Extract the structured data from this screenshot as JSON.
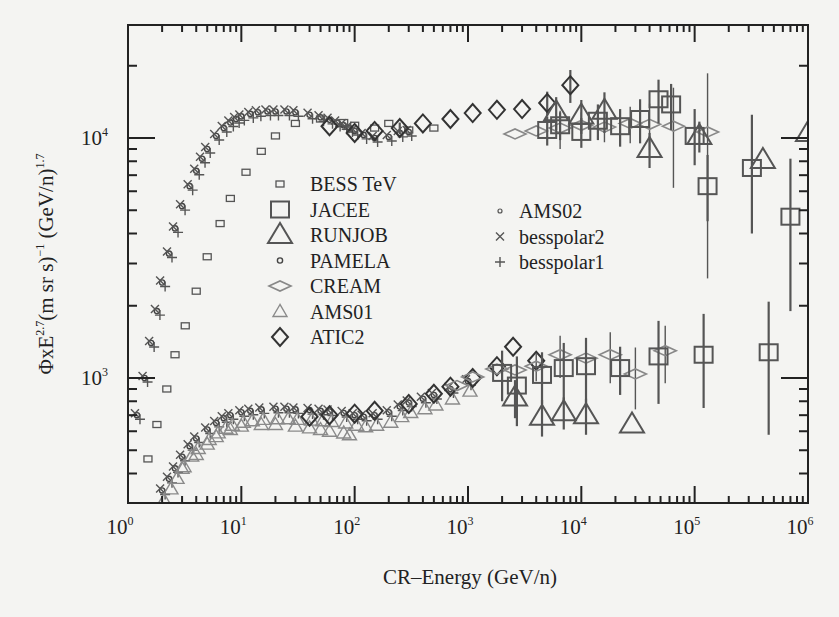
{
  "chart_data": {
    "type": "scatter",
    "title": "",
    "xlabel": "CR–Energy (GeV/n)",
    "ylabel": "ΦxE^2.7 (m sr s)^-1 (GeV/n)^1.7",
    "xscale": "log",
    "yscale": "log",
    "xlim": [
      1,
      1000000
    ],
    "ylim": [
      340,
      21000
    ],
    "x_ticks": [
      {
        "base": "10",
        "exp": "0",
        "value": 1
      },
      {
        "base": "10",
        "exp": "1",
        "value": 10
      },
      {
        "base": "10",
        "exp": "2",
        "value": 100
      },
      {
        "base": "10",
        "exp": "3",
        "value": 1000
      },
      {
        "base": "10",
        "exp": "4",
        "value": 10000
      },
      {
        "base": "10",
        "exp": "5",
        "value": 100000
      },
      {
        "base": "10",
        "exp": "6",
        "value": 1000000
      }
    ],
    "y_ticks": [
      {
        "base": "10",
        "exp": "3",
        "value": 1000
      },
      {
        "base": "10",
        "exp": "4",
        "value": 10000
      }
    ],
    "grid": false,
    "legend_position": "center-left (two columns)",
    "legend": [
      {
        "label": "BESS TeV",
        "marker": "small-square"
      },
      {
        "label": "JACEE",
        "marker": "large-square"
      },
      {
        "label": "RUNJOB",
        "marker": "large-triangle"
      },
      {
        "label": "PAMELA",
        "marker": "small-circle"
      },
      {
        "label": "CREAM",
        "marker": "flat-diamond"
      },
      {
        "label": "AMS01",
        "marker": "triangle-light"
      },
      {
        "label": "ATIC2",
        "marker": "diamond"
      },
      {
        "label": "AMS02",
        "marker": "tiny-circle"
      },
      {
        "label": "besspolar2",
        "marker": "x"
      },
      {
        "label": "besspolar1",
        "marker": "plus"
      }
    ],
    "series": [
      {
        "name": "Proton band (PAMELA/AMS/BESS combined)",
        "marker": "small-circle",
        "x": [
          1.2,
          1.4,
          1.6,
          1.8,
          2,
          2.3,
          2.6,
          3,
          3.5,
          4,
          4.5,
          5,
          6,
          7,
          8,
          9,
          10,
          12,
          14,
          17,
          20,
          25,
          30,
          40,
          50,
          60,
          70,
          80,
          90,
          100,
          120,
          150,
          200,
          250,
          300
        ],
        "y": [
          700,
          1000,
          1400,
          1900,
          2500,
          3300,
          4200,
          5200,
          6300,
          7300,
          8200,
          9000,
          10200,
          11000,
          11600,
          12000,
          12300,
          12600,
          12800,
          12900,
          12900,
          12900,
          12800,
          12500,
          12200,
          11900,
          11600,
          11300,
          11000,
          10700,
          10300,
          10000,
          10100,
          10500,
          10600
        ]
      },
      {
        "name": "BESS TeV (proton)",
        "marker": "small-square",
        "x": [
          1.5,
          1.8,
          2.2,
          2.6,
          3.2,
          4,
          5,
          6.5,
          8,
          11,
          15,
          20,
          30,
          50,
          80,
          100,
          150,
          200,
          300,
          500
        ],
        "y": [
          460,
          640,
          900,
          1250,
          1650,
          2300,
          3200,
          4400,
          5600,
          7200,
          8800,
          10200,
          11500,
          12000,
          11600,
          11300,
          11000,
          11500,
          10800,
          11000
        ]
      },
      {
        "name": "ATIC2 (proton)",
        "marker": "diamond",
        "x": [
          60,
          100,
          150,
          250,
          400,
          700,
          1100,
          1800,
          3000,
          5000,
          8000
        ],
        "y": [
          11200,
          10500,
          10700,
          11000,
          11500,
          12000,
          12700,
          13100,
          13200,
          14000,
          16600
        ],
        "err_lo": [
          0,
          0,
          0,
          600,
          0,
          0,
          0,
          0,
          0,
          1600,
          2600
        ],
        "err_hi": [
          0,
          0,
          0,
          600,
          0,
          0,
          0,
          0,
          0,
          1600,
          2600
        ]
      },
      {
        "name": "CREAM (proton)",
        "marker": "flat-diamond",
        "x": [
          2600,
          4000,
          6500,
          10000,
          16000,
          27000,
          40000,
          65000,
          130000
        ],
        "y": [
          10400,
          10700,
          11000,
          11300,
          11100,
          11500,
          11400,
          11200,
          10600
        ],
        "err_lo": [
          0,
          0,
          2000,
          1500,
          1500,
          2000,
          2500,
          5000,
          8000
        ],
        "err_hi": [
          0,
          0,
          2000,
          1500,
          1500,
          2000,
          2500,
          5000,
          8000
        ]
      },
      {
        "name": "JACEE (proton)",
        "marker": "large-square",
        "x": [
          5000,
          6500,
          10000,
          14000,
          22000,
          33000,
          48000,
          62000,
          100000,
          130000,
          320000,
          700000
        ],
        "y": [
          10800,
          11300,
          10600,
          11800,
          11200,
          12000,
          14500,
          13800,
          10200,
          6300,
          7500,
          4700
        ],
        "err_lo": [
          1500,
          1500,
          1500,
          2000,
          2000,
          2500,
          3000,
          3000,
          2500,
          1800,
          3500,
          2800
        ],
        "err_hi": [
          1500,
          1500,
          1500,
          2000,
          2000,
          2500,
          3000,
          3000,
          3000,
          2200,
          5000,
          3500
        ]
      },
      {
        "name": "RUNJOB (proton)",
        "marker": "large-triangle",
        "x": [
          6000,
          10000,
          16000,
          40000,
          110000,
          400000,
          1000000
        ],
        "y": [
          12800,
          12400,
          13000,
          9000,
          10200,
          8100,
          10500
        ],
        "err_lo": [
          2000,
          2000,
          2500,
          1500,
          1500,
          0,
          0
        ],
        "err_hi": [
          2000,
          2000,
          2500,
          1500,
          1500,
          0,
          0
        ]
      },
      {
        "name": "Helium band (PAMELA/AMS/BESS combined)",
        "marker": "small-circle",
        "x": [
          2,
          2.3,
          2.6,
          3,
          3.5,
          4,
          5,
          6,
          7,
          8,
          10,
          12,
          15,
          20,
          25,
          30,
          40,
          50,
          60,
          80,
          100,
          120,
          150,
          200,
          250,
          300,
          400,
          500,
          700,
          1000
        ],
        "y": [
          340,
          380,
          420,
          470,
          520,
          560,
          610,
          650,
          680,
          700,
          720,
          730,
          740,
          745,
          745,
          740,
          735,
          730,
          725,
          715,
          700,
          690,
          700,
          720,
          760,
          790,
          820,
          850,
          900,
          970
        ]
      },
      {
        "name": "AMS01 (helium)",
        "marker": "triangle-light",
        "x": [
          3,
          4,
          5,
          6,
          8,
          10,
          15,
          20,
          30,
          40,
          50,
          60,
          80,
          90
        ],
        "y": [
          420,
          480,
          530,
          570,
          610,
          630,
          640,
          640,
          630,
          620,
          610,
          600,
          590,
          580
        ]
      },
      {
        "name": "ATIC2 (helium)",
        "marker": "diamond",
        "x": [
          40,
          60,
          100,
          150,
          300,
          500,
          700,
          1100,
          1800,
          2500,
          4000
        ],
        "y": [
          690,
          700,
          710,
          730,
          780,
          860,
          920,
          1000,
          1120,
          1350,
          1180
        ]
      },
      {
        "name": "CREAM (helium)",
        "marker": "flat-diamond",
        "x": [
          800,
          1100,
          1800,
          2600,
          4000,
          6500,
          11000,
          18000,
          30000,
          55000
        ],
        "y": [
          930,
          1010,
          1090,
          1080,
          1120,
          1250,
          1210,
          1250,
          1040,
          1300
        ],
        "err_lo": [
          0,
          0,
          0,
          0,
          150,
          250,
          250,
          300,
          300,
          350
        ],
        "err_hi": [
          0,
          0,
          0,
          0,
          150,
          250,
          250,
          300,
          300,
          350
        ]
      },
      {
        "name": "JACEE (helium)",
        "marker": "large-square",
        "x": [
          2000,
          2700,
          4500,
          7000,
          11000,
          22000,
          48000,
          120000,
          450000
        ],
        "y": [
          1050,
          930,
          1030,
          1100,
          1120,
          1100,
          1230,
          1250,
          1280
        ],
        "err_lo": [
          250,
          300,
          250,
          300,
          350,
          250,
          450,
          500,
          700
        ],
        "err_hi": [
          250,
          300,
          250,
          300,
          350,
          250,
          500,
          600,
          800
        ]
      },
      {
        "name": "RUNJOB (helium)",
        "marker": "large-triangle",
        "x": [
          2600,
          4500,
          7000,
          11000,
          28000
        ],
        "y": [
          830,
          690,
          720,
          700,
          640
        ],
        "err_lo": [
          150,
          120,
          110,
          120,
          0
        ],
        "err_hi": [
          150,
          120,
          110,
          120,
          0
        ]
      }
    ]
  }
}
